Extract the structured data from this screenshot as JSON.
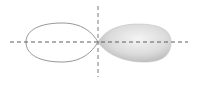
{
  "diagram": {
    "axes": {
      "horizontal": {
        "x1": 10,
        "x2": 188,
        "y": 42
      },
      "vertical": {
        "x": 98,
        "y1": 6,
        "y2": 77
      },
      "color": "#6a6a6a",
      "dash": "4 3"
    },
    "lobes": [
      {
        "name": "left-lobe",
        "style": "outline",
        "stroke": "#8a8a8a"
      },
      {
        "name": "right-lobe",
        "style": "filled",
        "fill_light": "#f2f2f2",
        "fill_dark": "#bdbdbd"
      }
    ]
  }
}
